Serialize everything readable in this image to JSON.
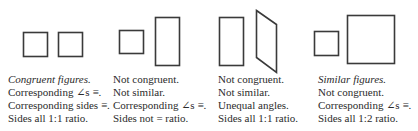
{
  "stroke_color": "#3a3a3a",
  "panels": [
    {
      "title": "Congruent figures.",
      "lines": [
        "Corresponding ∠s ≡.",
        "Corresponding sides ≡.",
        "Sides all 1:1 ratio."
      ],
      "title_italic": true
    },
    {
      "title": "Not congruent.",
      "lines": [
        "Not similar.",
        "Corresponding ∠s ≡.",
        "Sides not = ratio."
      ],
      "title_italic": false
    },
    {
      "title": "Not congruent.",
      "lines": [
        "Not similar.",
        "Unequal angles.",
        "Sides all 1:1 ratio."
      ],
      "title_italic": false
    },
    {
      "title": "Similar figures.",
      "lines": [
        "Not congruent.",
        "Corresponding ∠s ≡.",
        "Sides all 1:2 ratio."
      ],
      "title_italic": true
    }
  ],
  "shapes": [
    {
      "panel": 1,
      "type": "square",
      "label": "square-a"
    },
    {
      "panel": 1,
      "type": "square",
      "label": "square-b"
    },
    {
      "panel": 2,
      "type": "square",
      "label": "square"
    },
    {
      "panel": 2,
      "type": "rectangle",
      "label": "tall-rectangle"
    },
    {
      "panel": 3,
      "type": "rectangle",
      "label": "rectangle"
    },
    {
      "panel": 3,
      "type": "parallelogram",
      "label": "parallelogram"
    },
    {
      "panel": 4,
      "type": "square",
      "label": "small-square"
    },
    {
      "panel": 4,
      "type": "square",
      "label": "large-square (2x)"
    }
  ]
}
